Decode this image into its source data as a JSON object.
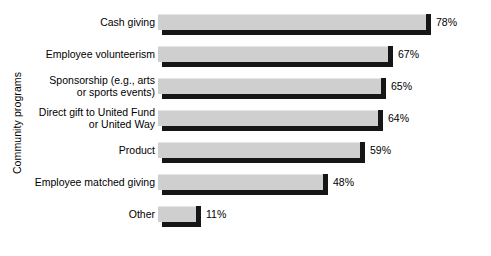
{
  "chart_data": {
    "type": "bar",
    "orientation": "horizontal",
    "title": "",
    "subtitle": "",
    "xlabel": "",
    "ylabel": "Community programs",
    "grid": false,
    "legend": null,
    "value_suffix": "%",
    "xlim": [
      0,
      100
    ],
    "categories": [
      "Cash giving",
      "Employee volunteerism",
      "Sponsorship (e.g., arts\nor sports events)",
      "Direct gift to United Fund\nor United Way",
      "Product",
      "Employee matched giving",
      "Other"
    ],
    "values": [
      78,
      67,
      65,
      64,
      59,
      48,
      11
    ],
    "value_labels": [
      "78%",
      "67%",
      "65%",
      "64%",
      "59%",
      "48%",
      "11%"
    ],
    "colors": {
      "bar_face": "#cfcfcf",
      "bar_shadow": "#161616",
      "background": "#ffffff",
      "text": "#000000"
    }
  },
  "axis": {
    "y_title": "Community programs"
  }
}
